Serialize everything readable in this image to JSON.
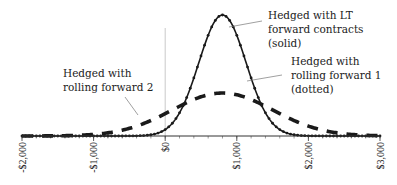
{
  "chart_data": {
    "type": "line",
    "title": "",
    "xlabel": "",
    "ylabel": "",
    "xlim": [
      -2000,
      3000
    ],
    "x_ticks": [
      -2000,
      -1000,
      0,
      1000,
      2000,
      3000
    ],
    "x_tick_labels": [
      "-$2,000",
      "-$1,000",
      "$0",
      "$1,000",
      "$2,000",
      "$3,000"
    ],
    "minor_tick_step": 200,
    "reference_line_x": 0,
    "grid": false,
    "y_axis_shown": false,
    "series": [
      {
        "name": "Hedged with LT forward contracts (solid)",
        "style": "solid-with-markers",
        "distribution": "normal",
        "mean": 800,
        "sd": 330,
        "relative_peak": 1.0,
        "label_lines": [
          "Hedged with LT",
          "forward contracts",
          "(solid)"
        ]
      },
      {
        "name": "Hedged with rolling forward 1 (dotted)",
        "style": "solid-with-markers",
        "distribution": "normal",
        "mean": 800,
        "sd": 330,
        "relative_peak": 1.0,
        "label_lines": [
          "Hedged with",
          "rolling forward 1",
          "(dotted)"
        ]
      },
      {
        "name": "Hedged with rolling forward 2",
        "style": "dashed",
        "distribution": "normal",
        "mean": 800,
        "sd": 700,
        "relative_peak": 0.355,
        "label_lines": [
          "Hedged with",
          "rolling forward 2"
        ]
      }
    ],
    "colors": {
      "line": "#1a1a1a",
      "axis": "#333333",
      "reference": "#bbbbbb",
      "leader": "#777777"
    }
  }
}
